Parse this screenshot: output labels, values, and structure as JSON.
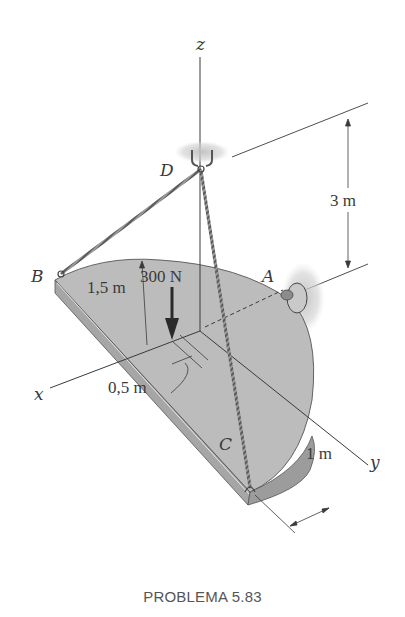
{
  "figure": {
    "caption": "PROBLEMA 5.83",
    "axes": {
      "x": "x",
      "y": "y",
      "z": "z"
    },
    "points": {
      "A": "A",
      "B": "B",
      "C": "C",
      "D": "D"
    },
    "load": {
      "label": "300 N",
      "value": 300,
      "unit": "N",
      "direction": "down"
    },
    "dimensions": {
      "height_D": "3 m",
      "radius": "1,5 m",
      "load_offset": "0,5 m",
      "C_offset": "1 m"
    },
    "colors": {
      "plate_top": "#bdbdbd",
      "plate_edge": "#9e9e9e",
      "line": "#3a3a3a",
      "support_shadow": "#c8c8c8"
    }
  }
}
